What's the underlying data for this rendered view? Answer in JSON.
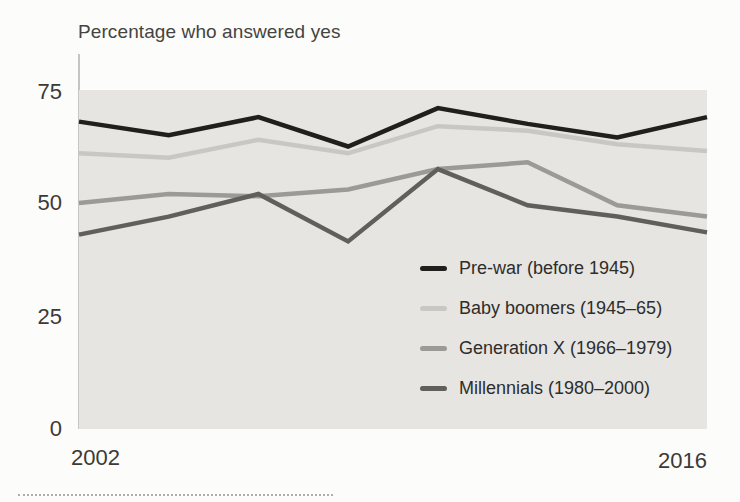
{
  "y_axis": {
    "tick_labels": [
      "75",
      "50",
      "25",
      "0"
    ]
  },
  "x_axis": {
    "start_label": "2002",
    "end_label": "2016"
  },
  "chart_data": {
    "type": "line",
    "title": "Percentage who answered yes",
    "x": [
      2002,
      2004,
      2006,
      2008,
      2010,
      2012,
      2014,
      2016
    ],
    "series": [
      {
        "name": "Pre-war (before 1945)",
        "color": "#201f1d",
        "values": [
          68,
          65,
          69,
          62.5,
          71,
          67.5,
          64.5,
          69
        ]
      },
      {
        "name": "Baby boomers (1945–65)",
        "color": "#c9c7c3",
        "values": [
          61,
          60,
          64,
          61,
          67,
          66,
          63,
          61.5
        ]
      },
      {
        "name": "Generation X (1966–1979)",
        "color": "#9b9a96",
        "values": [
          50,
          52,
          51.5,
          53,
          57.5,
          59,
          49.5,
          47
        ]
      },
      {
        "name": "Millennials (1980–2000)",
        "color": "#605f5d",
        "values": [
          43,
          47,
          52,
          41.5,
          57.5,
          49.5,
          47,
          43.5
        ]
      }
    ],
    "draw_order": [
      2,
      3,
      1,
      0
    ],
    "line_width": 4.5,
    "xlim": [
      2002,
      2016
    ],
    "ylim": [
      0,
      75
    ],
    "yticks": [
      0,
      25,
      50,
      75
    ],
    "xticks_shown": [
      2002,
      2016
    ],
    "grid": false,
    "plot_bg": "#e6e5e2",
    "legend_position": "inside-right-middle"
  }
}
